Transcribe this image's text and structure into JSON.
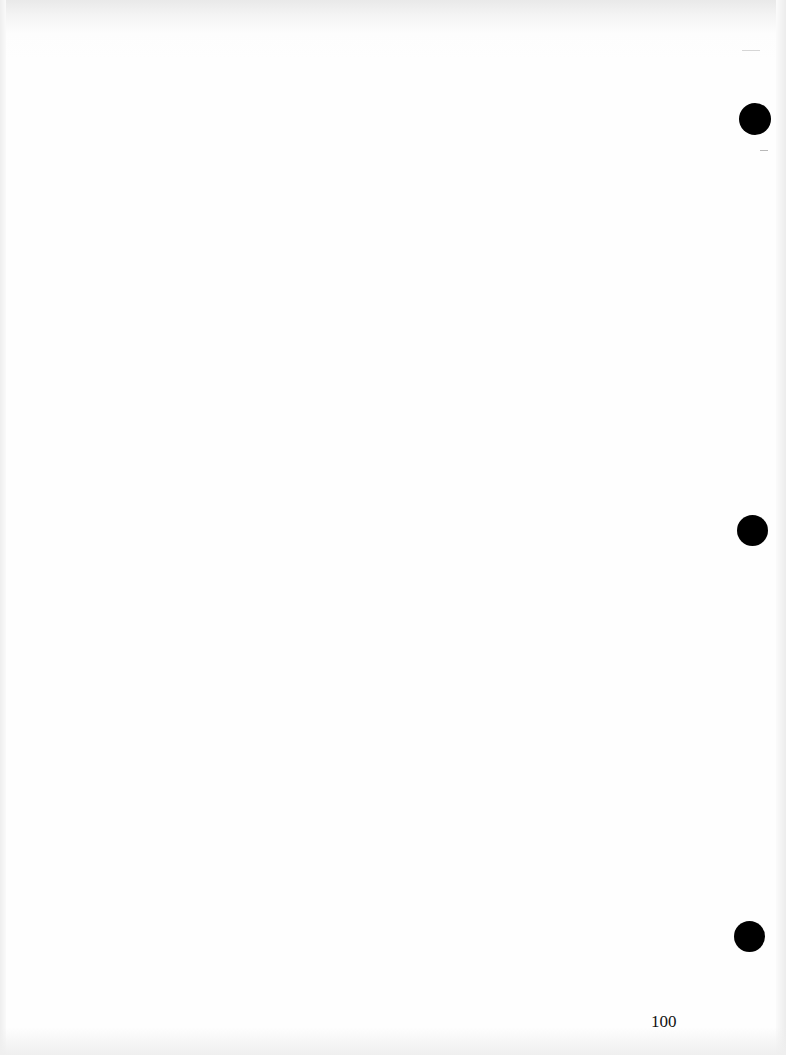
{
  "document": {
    "type": "scanned blank page",
    "page_number": "100",
    "hole_punches": 3
  }
}
